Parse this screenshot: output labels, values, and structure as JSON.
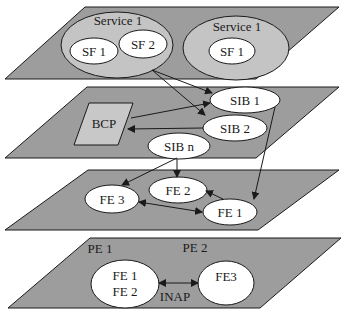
{
  "colors": {
    "plane_fill": "#9d9d9d",
    "service_fill": "#c4c4c4",
    "bcp_fill": "#c8c8c8",
    "node_fill": "#ffffff",
    "stroke": "#1a1a1a"
  },
  "planes": {
    "service_plane": {
      "services": [
        {
          "label": "Service 1",
          "features": [
            {
              "label": "SF 1"
            },
            {
              "label": "SF 2"
            }
          ]
        },
        {
          "label": "Service 1",
          "features": [
            {
              "label": "SF 1"
            }
          ]
        }
      ]
    },
    "global_functional_plane": {
      "bcp": {
        "label": "BCP"
      },
      "sibs": [
        {
          "label": "SIB 1"
        },
        {
          "label": "SIB 2"
        },
        {
          "label": "SIB n"
        }
      ]
    },
    "distributed_functional_plane": {
      "fes": [
        {
          "label": "FE 3"
        },
        {
          "label": "FE 2"
        },
        {
          "label": "FE 1"
        }
      ]
    },
    "physical_plane": {
      "pes": [
        {
          "label": "PE 1"
        },
        {
          "label": "PE 2"
        }
      ],
      "pe1_fes": [
        {
          "label": "FE 1"
        },
        {
          "label": "FE 2"
        }
      ],
      "pe2_fe": {
        "label": "FE3"
      },
      "protocol_label": "INAP"
    }
  },
  "connections": [
    {
      "from": "SF 2",
      "to": "SIB 1",
      "type": "arrow"
    },
    {
      "from": "SF 2",
      "to": "SIB 2",
      "type": "arrow"
    },
    {
      "from": "BCP",
      "to": "SIB 1",
      "type": "arrow"
    },
    {
      "from": "SIB 2",
      "to": "BCP",
      "type": "arrow"
    },
    {
      "from": "SIB 1",
      "to": "FE 1",
      "type": "arrow"
    },
    {
      "from": "SIB n",
      "to": "FE 3",
      "type": "arrow"
    },
    {
      "from": "SIB n",
      "to": "FE 2",
      "type": "arrow"
    },
    {
      "from": "FE 1",
      "to": "FE 2",
      "type": "arrow"
    },
    {
      "from": "FE 3",
      "to": "FE 1",
      "type": "bidirectional"
    },
    {
      "from": "PE 1 (FE 1, FE 2)",
      "to": "PE 2 (FE3)",
      "type": "bidirectional",
      "label": "INAP"
    }
  ]
}
